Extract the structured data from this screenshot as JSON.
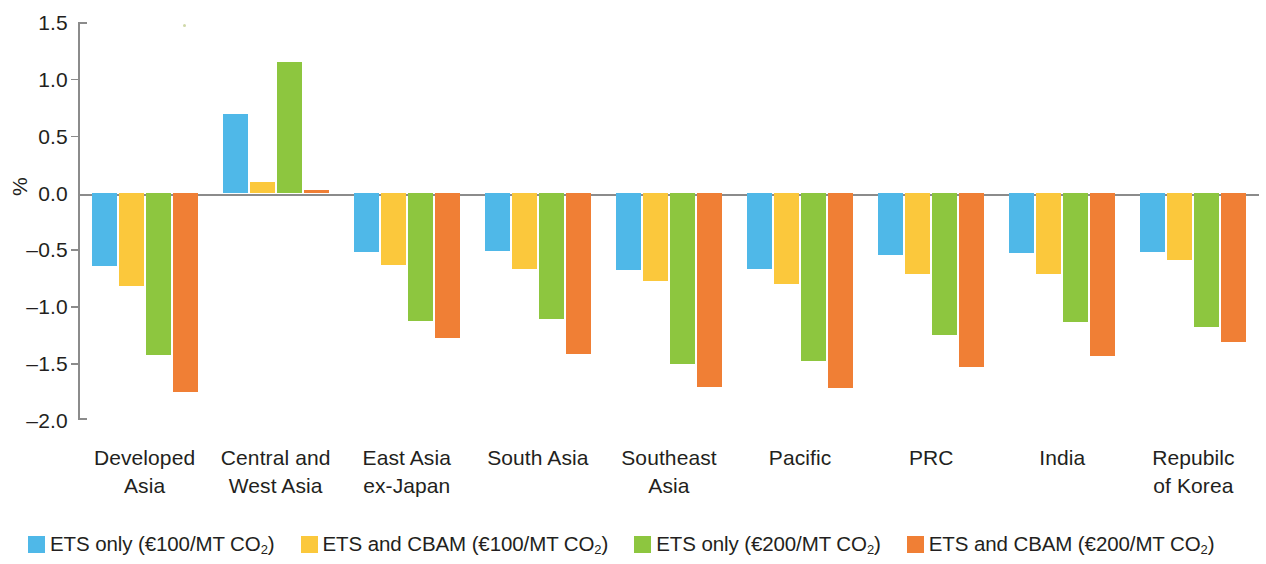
{
  "chart_data": {
    "type": "bar",
    "title": "",
    "subtitle": "",
    "xlabel": "",
    "ylabel": "%",
    "ylim": [
      -2.0,
      1.5
    ],
    "ytick_labels": [
      "1.5",
      "1.0",
      "0.5",
      "0.0",
      "-0.5",
      "-1.0",
      "-1.5",
      "-2.0"
    ],
    "ytick_values": [
      1.5,
      1.0,
      0.5,
      0.0,
      -0.5,
      -1.0,
      -1.5,
      -2.0
    ],
    "grid": false,
    "legend_position": "bottom",
    "categories": [
      "Developed\nAsia",
      "Central and\nWest Asia",
      "East Asia\nex-Japan",
      "South Asia",
      "Southeast\nAsia",
      "Pacific",
      "PRC",
      "India",
      "Repubilc\nof Korea"
    ],
    "category_lines": [
      [
        "Developed",
        "Asia"
      ],
      [
        "Central and",
        "West Asia"
      ],
      [
        "East Asia",
        "ex-Japan"
      ],
      [
        "South Asia",
        ""
      ],
      [
        "Southeast",
        "Asia"
      ],
      [
        "Pacific",
        ""
      ],
      [
        "PRC",
        ""
      ],
      [
        "India",
        ""
      ],
      [
        "Repubilc",
        "of Korea"
      ]
    ],
    "series": [
      {
        "name": "ETS only (€100/MT CO₂)",
        "color": "#4FB8E8",
        "values": [
          -0.65,
          0.69,
          -0.52,
          -0.51,
          -0.68,
          -0.67,
          -0.55,
          -0.53,
          -0.52
        ]
      },
      {
        "name": "ETS and CBAM (€100/MT CO₂)",
        "color": "#FBC83C",
        "values": [
          -0.82,
          0.09,
          -0.64,
          -0.67,
          -0.78,
          -0.8,
          -0.72,
          -0.72,
          -0.59
        ]
      },
      {
        "name": "ETS only (€200/MT CO₂)",
        "color": "#8DC63F",
        "values": [
          -1.43,
          1.15,
          -1.13,
          -1.11,
          -1.51,
          -1.48,
          -1.25,
          -1.14,
          -1.18
        ]
      },
      {
        "name": "ETS and CBAM (€200/MT CO₂)",
        "color": "#F07F35",
        "values": [
          -1.75,
          0.02,
          -1.28,
          -1.42,
          -1.71,
          -1.72,
          -1.53,
          -1.44,
          -1.31
        ]
      }
    ]
  },
  "legend": {
    "items": [
      {
        "label_main": "ETS only (€100/MT CO",
        "label_sub": "2",
        "label_tail": ")",
        "color": "#4FB8E8"
      },
      {
        "label_main": "ETS and CBAM (€100/MT CO",
        "label_sub": "2",
        "label_tail": ")",
        "color": "#FBC83C"
      },
      {
        "label_main": "ETS only (€200/MT CO",
        "label_sub": "2",
        "label_tail": ")",
        "color": "#8DC63F"
      },
      {
        "label_main": "ETS and CBAM (€200/MT CO",
        "label_sub": "2",
        "label_tail": ")",
        "color": "#F07F35"
      }
    ]
  },
  "axis": {
    "y_title": "%"
  }
}
